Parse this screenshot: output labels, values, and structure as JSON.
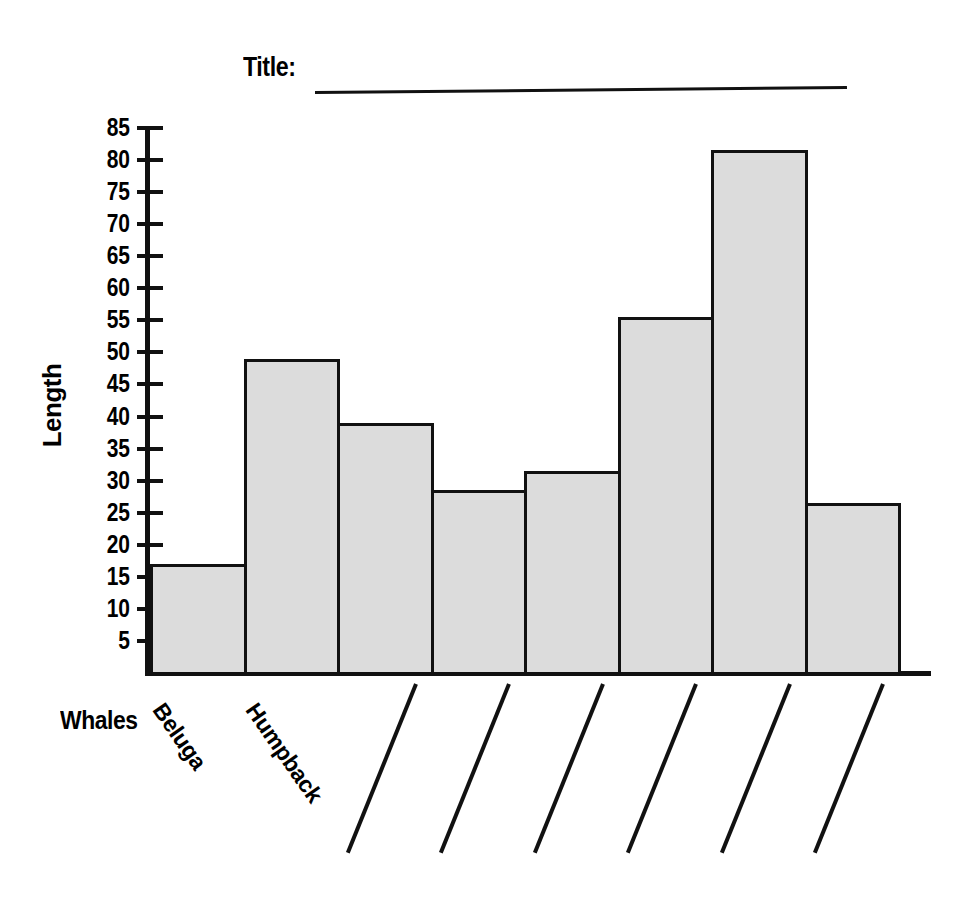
{
  "worksheet": {
    "title_label": "Title:",
    "title_value": "",
    "title_blank_name": "title-fill-in-line"
  },
  "axes": {
    "y_title": "Length",
    "x_title": "Whales",
    "y_ticks": [
      85,
      80,
      75,
      70,
      65,
      60,
      55,
      50,
      45,
      40,
      35,
      30,
      25,
      20,
      15,
      10,
      5
    ],
    "y_min": 0,
    "y_max": 85
  },
  "categories": [
    {
      "label": "Beluga",
      "filled": true
    },
    {
      "label": "Humpback",
      "filled": true
    },
    {
      "label": "",
      "filled": false
    },
    {
      "label": "",
      "filled": false
    },
    {
      "label": "",
      "filled": false
    },
    {
      "label": "",
      "filled": false
    },
    {
      "label": "",
      "filled": false
    },
    {
      "label": "",
      "filled": false
    }
  ],
  "colors": {
    "bar_fill": "#dcdcdc",
    "bar_stroke": "#111111",
    "axis": "#111111",
    "background": "#ffffff"
  },
  "chart_data": {
    "type": "bar",
    "title": "Title:",
    "xlabel": "Whales",
    "ylabel": "Length",
    "categories": [
      "Beluga",
      "Humpback",
      "",
      "",
      "",
      "",
      "",
      ""
    ],
    "values": [
      17,
      49,
      39,
      28.5,
      31.5,
      55.5,
      81.5,
      26.5
    ],
    "ylim": [
      0,
      85
    ],
    "ytick_step": 5,
    "grid": false,
    "legend": false,
    "bar_fill_color": "#dcdcdc",
    "bar_edge_color": "#111111"
  }
}
